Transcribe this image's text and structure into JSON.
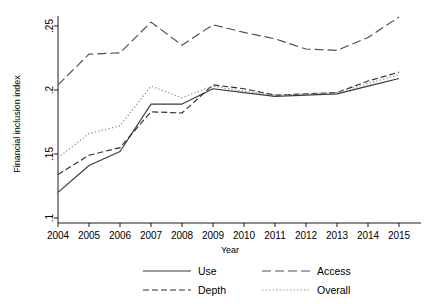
{
  "chart_data": {
    "type": "line",
    "title": "",
    "xlabel": "Year",
    "ylabel": "Financial inclusion index",
    "x": [
      2004,
      2005,
      2006,
      2007,
      2008,
      2009,
      2010,
      2011,
      2012,
      2013,
      2014,
      2015
    ],
    "xtick_labels": [
      "2004",
      "2005",
      "2006",
      "2007",
      "2008",
      "2009",
      "2010",
      "2011",
      "2012",
      "2013",
      "2014",
      "2015"
    ],
    "ytick_labels": [
      ".1",
      ".15",
      ".2",
      ".25"
    ],
    "ytick_values": [
      0.1,
      0.15,
      0.2,
      0.25
    ],
    "xlim": [
      2004,
      2015
    ],
    "ylim": [
      0.095,
      0.262
    ],
    "grid": false,
    "legend_position": "bottom",
    "series": [
      {
        "name": "Use",
        "style": "solid",
        "color": "#3a3a3a",
        "values": [
          0.12,
          0.141,
          0.152,
          0.189,
          0.189,
          0.201,
          0.198,
          0.195,
          0.196,
          0.197,
          0.203,
          0.209
        ]
      },
      {
        "name": "Access",
        "style": "long-dash",
        "color": "#4a4a58",
        "values": [
          0.204,
          0.228,
          0.229,
          0.253,
          0.235,
          0.251,
          0.245,
          0.24,
          0.232,
          0.231,
          0.241,
          0.257
        ]
      },
      {
        "name": "Depth",
        "style": "dash",
        "color": "#2f2f2f",
        "values": [
          0.134,
          0.149,
          0.155,
          0.183,
          0.182,
          0.204,
          0.201,
          0.196,
          0.197,
          0.198,
          0.207,
          0.214
        ]
      },
      {
        "name": "Overall",
        "style": "dotted",
        "color": "#8a8a8a",
        "values": [
          0.147,
          0.166,
          0.172,
          0.203,
          0.194,
          0.203,
          0.199,
          0.196,
          0.197,
          0.198,
          0.205,
          0.212
        ]
      }
    ]
  },
  "legend": {
    "entries": [
      {
        "label": "Use",
        "style": "solid"
      },
      {
        "label": "Access",
        "style": "long-dash"
      },
      {
        "label": "Depth",
        "style": "dash"
      },
      {
        "label": "Overall",
        "style": "dotted"
      }
    ]
  }
}
